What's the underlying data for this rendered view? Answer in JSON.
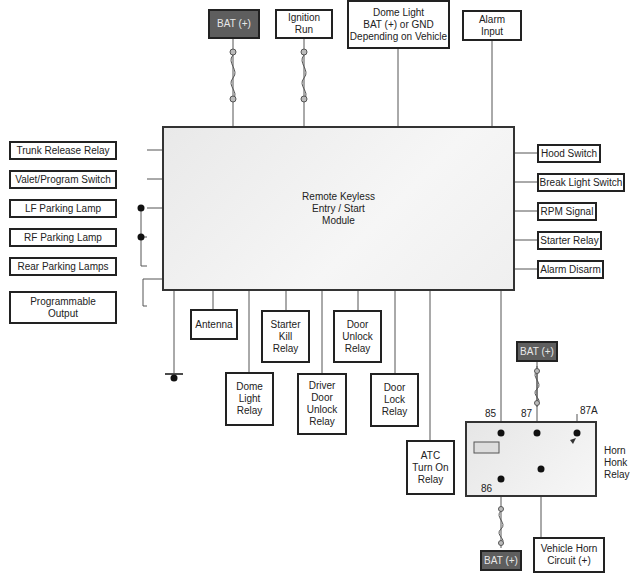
{
  "diagram": {
    "module": {
      "label": "Remote Keyless\nEntry / Start\nModule"
    },
    "top_inputs": [
      {
        "label": "BAT (+)",
        "style": "dark",
        "fused": true
      },
      {
        "label": "Ignition\nRun",
        "fused": true
      },
      {
        "label": "Dome Light\nBAT (+) or GND\nDepending on Vehicle"
      },
      {
        "label": "Alarm\nInput"
      }
    ],
    "left_items": [
      {
        "label": "Trunk Release Relay"
      },
      {
        "label": "Valet/Program Switch"
      },
      {
        "label": "LF Parking Lamp"
      },
      {
        "label": "RF Parking Lamp"
      },
      {
        "label": "Rear Parking Lamps"
      },
      {
        "label": "Programmable\nOutput"
      }
    ],
    "right_items": [
      {
        "label": "Hood Switch"
      },
      {
        "label": "Break Light Switch"
      },
      {
        "label": "RPM Signal"
      },
      {
        "label": "Starter Relay"
      },
      {
        "label": "Alarm Disarm"
      }
    ],
    "bottom_items": [
      {
        "label": "Antenna"
      },
      {
        "label": "Starter\nKill\nRelay"
      },
      {
        "label": "Door\nUnlock\nRelay"
      },
      {
        "label": "Dome\nLight\nRelay"
      },
      {
        "label": "Driver\nDoor\nUnlock\nRelay"
      },
      {
        "label": "Door\nLock\nRelay"
      },
      {
        "label": "ATC\nTurn On\nRelay"
      }
    ],
    "horn_relay": {
      "label": "Horn\nHonk\nRelay",
      "pins": {
        "p85": "85",
        "p86": "86",
        "p87": "87",
        "p87a": "87A"
      },
      "bat_top": "BAT (+)",
      "bat_bottom": "BAT (+)",
      "horn_circuit": "Vehicle Horn\nCircuit (+)"
    },
    "colors": {
      "line": "#555555",
      "box_border": "#222222",
      "bat_fill": "#5e5e5e",
      "module_fill": "#efefef"
    }
  }
}
